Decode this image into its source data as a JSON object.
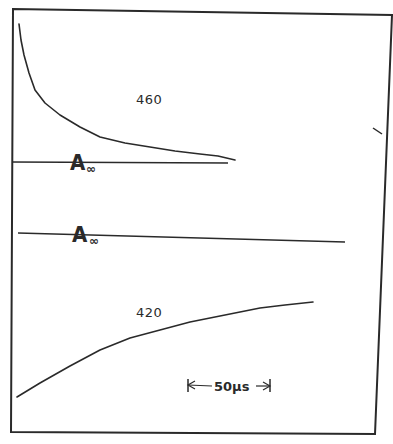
{
  "chart_data": [
    {
      "type": "line",
      "title": "",
      "trace_label": "460",
      "description": "Transient absorption decay trace at 460 nm",
      "baseline_label": "A∞",
      "xlabel": "time",
      "ylabel": "absorbance",
      "grid": false,
      "x_scale_bar": "50µs",
      "points_px": [
        [
          19,
          24
        ],
        [
          21,
          40
        ],
        [
          24,
          55
        ],
        [
          29,
          73
        ],
        [
          35,
          90
        ],
        [
          45,
          103
        ],
        [
          60,
          115
        ],
        [
          80,
          127
        ],
        [
          100,
          137
        ],
        [
          125,
          143
        ],
        [
          150,
          147
        ],
        [
          175,
          151
        ],
        [
          200,
          154
        ],
        [
          218,
          156
        ],
        [
          235,
          160
        ]
      ],
      "baseline_px": [
        [
          12,
          162
        ],
        [
          228,
          163
        ]
      ]
    },
    {
      "type": "line",
      "title": "",
      "trace_label": "420",
      "description": "Transient absorption recovery trace at 420 nm",
      "baseline_label": "A∞",
      "xlabel": "time",
      "ylabel": "absorbance",
      "grid": false,
      "x_scale_bar": "50µs",
      "points_px": [
        [
          17,
          397
        ],
        [
          40,
          383
        ],
        [
          70,
          366
        ],
        [
          100,
          350
        ],
        [
          130,
          338
        ],
        [
          160,
          330
        ],
        [
          190,
          322
        ],
        [
          220,
          316
        ],
        [
          240,
          312
        ],
        [
          260,
          308
        ],
        [
          285,
          305
        ],
        [
          313,
          302
        ]
      ],
      "baseline_px": [
        [
          18,
          233
        ],
        [
          345,
          242
        ]
      ]
    }
  ],
  "figure": {
    "frame_corners_px": [
      [
        13,
        9
      ],
      [
        392,
        15
      ],
      [
        375,
        434
      ],
      [
        11,
        432
      ]
    ],
    "right_tick_px": [
      [
        373,
        128
      ],
      [
        382,
        134
      ]
    ],
    "stroke_color": "#2a2a2a",
    "background": "#ffffff"
  },
  "labels": {
    "trace_top": "460",
    "trace_bottom": "420",
    "baseline_top_A": "A",
    "baseline_top_sub": "∞",
    "baseline_bottom_A": "A",
    "baseline_bottom_sub": "∞",
    "scale_bar_text": "50µs"
  }
}
